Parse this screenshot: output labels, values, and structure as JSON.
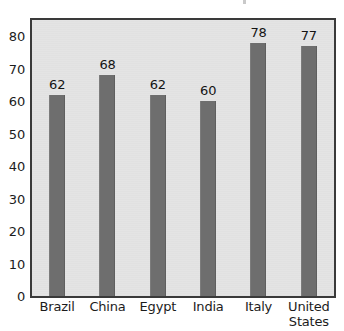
{
  "chart_data": {
    "type": "bar",
    "title": "",
    "subtitle": "",
    "xlabel": "",
    "ylabel": "",
    "categories": [
      "Brazil",
      "China",
      "Egypt",
      "India",
      "Italy",
      "United States"
    ],
    "category_lines": [
      [
        "Brazil"
      ],
      [
        "China"
      ],
      [
        "Egypt"
      ],
      [
        "India"
      ],
      [
        "Italy"
      ],
      [
        "United",
        "States"
      ]
    ],
    "values": [
      62,
      68,
      62,
      60,
      78,
      77
    ],
    "data_labels": [
      "62",
      "68",
      "62",
      "60",
      "78",
      "77"
    ],
    "ylim": [
      0,
      85
    ],
    "y_ticks": [
      0,
      10,
      20,
      30,
      40,
      50,
      60,
      70,
      80
    ],
    "y_tick_labels": [
      "0",
      "10",
      "20",
      "30",
      "40",
      "50",
      "60",
      "70",
      "80"
    ],
    "grid": false,
    "legend": null,
    "legend_position": "none",
    "bar_color": "#6e6e6e",
    "plot_background": "#e4e4e4",
    "frame_color": "#3a3a3a",
    "page_background": "#ffffff",
    "text_color": "#1c1c1c"
  }
}
